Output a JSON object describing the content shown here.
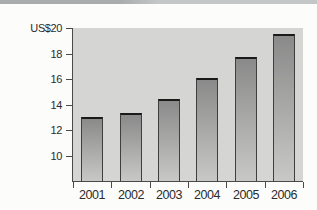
{
  "page": {
    "background": "#fcfcfb",
    "top_strip_gradient_left": "#a9acac",
    "top_strip_gradient_right": "#c3c7c7"
  },
  "chart_data": {
    "type": "bar",
    "title": "",
    "xlabel": "",
    "ylabel": "US$",
    "categories": [
      "2001",
      "2002",
      "2003",
      "2004",
      "2005",
      "2006"
    ],
    "values": [
      13.0,
      13.3,
      14.4,
      16.1,
      17.7,
      19.5
    ],
    "y_ticks": [
      20,
      18,
      16,
      14,
      12,
      10
    ],
    "y_tick_labels": [
      "US$20",
      "18",
      "16",
      "14",
      "12",
      "10"
    ],
    "ylim": [
      8,
      20
    ],
    "grid": false,
    "legend": null,
    "colors": {
      "plot_background": "#d5d6d3",
      "bar_gradient_top": "#8a8a8a",
      "bar_gradient_bottom": "#c8c8c6",
      "bar_border": "#3f3f3f",
      "bar_top_cap": "#1a1a1a",
      "axis": "#4a4a4a",
      "tick": "#4a4a4a",
      "label_text": "#2b2b2b"
    }
  }
}
